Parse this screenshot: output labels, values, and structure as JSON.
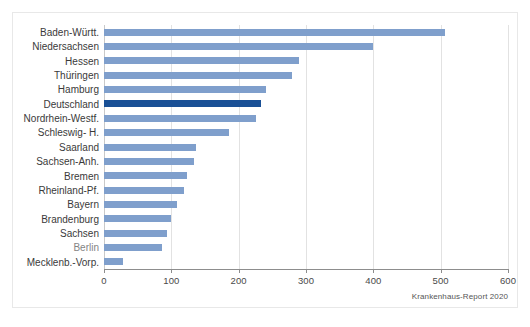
{
  "source_note": "Krankenhaus-Report 2020",
  "colors": {
    "bar": "#7f9fcc",
    "highlight_bar": "#1a5096",
    "gridline": "#e2e2e2",
    "axis": "#8d8d8d",
    "frame": "#e8e8e8",
    "text": "#3a3a3a"
  },
  "chart_data": {
    "type": "bar",
    "orientation": "horizontal",
    "title": "",
    "subtitle": "",
    "xlabel": "",
    "ylabel": "",
    "xlim": [
      0,
      600
    ],
    "xticks": [
      0,
      100,
      200,
      300,
      400,
      500,
      600
    ],
    "xtick_labels": [
      "0",
      "100",
      "200",
      "300",
      "400",
      "500",
      "600"
    ],
    "grid": true,
    "grid_axis": "x",
    "legend": false,
    "annotations": [
      "Krankenhaus-Report 2020"
    ],
    "highlight_category": "Deutschland",
    "categories": [
      "Baden-Württ.",
      "Niedersachsen",
      "Hessen",
      "Thüringen",
      "Hamburg",
      "Deutschland",
      "Nordrhein-Westf.",
      "Schleswig- H.",
      "Saarland",
      "Sachsen-Anh.",
      "Bremen",
      "Rheinland-Pf.",
      "Bayern",
      "Brandenburg",
      "Sachsen",
      "Berlin",
      "Mecklenb.-Vorp."
    ],
    "values": [
      507,
      399,
      290,
      279,
      240,
      233,
      226,
      185,
      136,
      134,
      123,
      119,
      109,
      99,
      94,
      86,
      28
    ]
  }
}
